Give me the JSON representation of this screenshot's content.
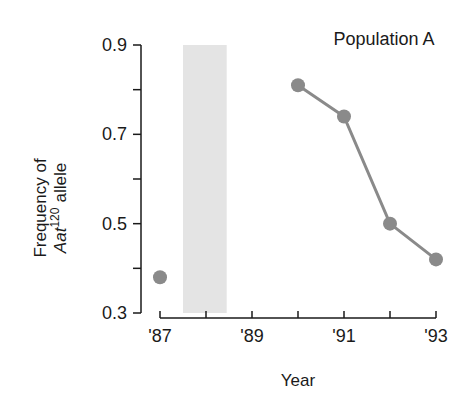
{
  "chart_data": {
    "type": "line",
    "title": "Population A",
    "xlabel": "Year",
    "ylabel_line1": "Frequency of",
    "ylabel_gene": "Aat",
    "ylabel_superscript": "120",
    "ylabel_suffix": "allele",
    "xlim": [
      87,
      93
    ],
    "ylim": [
      0.3,
      0.9
    ],
    "x_ticks": [
      87,
      88,
      89,
      90,
      91,
      92,
      93
    ],
    "x_tick_labels": [
      "'87",
      "",
      "'89",
      "",
      "'91",
      "",
      "'93"
    ],
    "y_ticks": [
      0.3,
      0.4,
      0.5,
      0.6,
      0.7,
      0.8,
      0.9
    ],
    "y_tick_labels": [
      "0.3",
      "",
      "0.5",
      "",
      "0.7",
      "",
      "0.9"
    ],
    "grid": false,
    "shaded_region": {
      "x_start": 87.5,
      "x_end": 88.45,
      "color": "#e4e4e4"
    },
    "series": [
      {
        "name": "Population A",
        "points": [
          {
            "x": 87,
            "y": 0.38,
            "connected": false
          },
          {
            "x": 90,
            "y": 0.81,
            "connected": true
          },
          {
            "x": 91,
            "y": 0.74,
            "connected": true
          },
          {
            "x": 92,
            "y": 0.5,
            "connected": true
          },
          {
            "x": 93,
            "y": 0.42,
            "connected": true
          }
        ],
        "color": "#8a8a8a"
      }
    ]
  },
  "colors": {
    "axis": "#1a1a1a",
    "point": "#8a8a8a",
    "line": "#8a8a8a",
    "shade": "#e4e4e4"
  }
}
